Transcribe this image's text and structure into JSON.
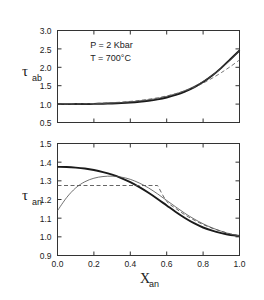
{
  "figure": {
    "background": "#ffffff",
    "line_color": "#1a1a1a",
    "thin_color": "#4d4d4d",
    "dash_color": "#555555"
  },
  "chart_data": [
    {
      "type": "line",
      "panel": "top",
      "title": "",
      "xlabel": "",
      "ylabel": "τab",
      "ylabel_main": "τ",
      "ylabel_sub": "ab",
      "xlim": [
        0.0,
        1.0
      ],
      "ylim": [
        0.5,
        3.0
      ],
      "yticks": [
        "0.5",
        "1.0",
        "1.5",
        "2.0",
        "2.5",
        "3.0"
      ],
      "ytick_values": [
        0.5,
        1.0,
        1.5,
        2.0,
        2.5,
        3.0
      ],
      "xticks": [
        "0.0",
        "0.2",
        "0.4",
        "0.6",
        "0.8",
        "1.0"
      ],
      "xtick_values": [
        0.0,
        0.2,
        0.4,
        0.6,
        0.8,
        1.0
      ],
      "xtick_labels_visible": false,
      "grid": false,
      "legend": "none",
      "annotations": [
        {
          "text": "P = 2 Kbar",
          "x": 0.18,
          "y": 2.52
        },
        {
          "text": "T = 700°C",
          "x": 0.18,
          "y": 2.18
        }
      ],
      "x": [
        0.0,
        0.05,
        0.1,
        0.15,
        0.2,
        0.25,
        0.3,
        0.35,
        0.4,
        0.45,
        0.5,
        0.55,
        0.6,
        0.65,
        0.7,
        0.75,
        0.8,
        0.85,
        0.9,
        0.95,
        1.0
      ],
      "series": [
        {
          "name": "bold-curve",
          "style": "solid-bold",
          "values": [
            1.0,
            1.0,
            1.001,
            1.003,
            1.006,
            1.011,
            1.018,
            1.028,
            1.042,
            1.062,
            1.09,
            1.128,
            1.18,
            1.25,
            1.34,
            1.455,
            1.6,
            1.775,
            1.985,
            2.22,
            2.455
          ]
        },
        {
          "name": "thin-curve",
          "style": "solid-thin",
          "values": [
            1.0,
            1.001,
            1.003,
            1.006,
            1.011,
            1.018,
            1.028,
            1.042,
            1.06,
            1.084,
            1.115,
            1.156,
            1.21,
            1.28,
            1.368,
            1.478,
            1.615,
            1.78,
            1.975,
            2.2,
            2.45
          ]
        },
        {
          "name": "dashed-curve",
          "style": "dashed",
          "values": [
            1.0,
            1.002,
            1.005,
            1.01,
            1.017,
            1.026,
            1.038,
            1.054,
            1.074,
            1.1,
            1.132,
            1.172,
            1.222,
            1.285,
            1.362,
            1.455,
            1.57,
            1.705,
            1.855,
            2.02,
            2.2
          ]
        }
      ]
    },
    {
      "type": "line",
      "panel": "bottom",
      "title": "",
      "xlabel": "Xan",
      "xlabel_main": "X",
      "xlabel_sub": "an",
      "ylabel": "τan",
      "ylabel_main": "τ",
      "ylabel_sub": "an",
      "xlim": [
        0.0,
        1.0
      ],
      "ylim": [
        0.9,
        1.5
      ],
      "yticks": [
        "0.9",
        "1.0",
        "1.1",
        "1.2",
        "1.3",
        "1.4",
        "1.5"
      ],
      "ytick_values": [
        0.9,
        1.0,
        1.1,
        1.2,
        1.3,
        1.4,
        1.5
      ],
      "xticks": [
        "0.0",
        "0.2",
        "0.4",
        "0.6",
        "0.8",
        "1.0"
      ],
      "xtick_values": [
        0.0,
        0.2,
        0.4,
        0.6,
        0.8,
        1.0
      ],
      "xtick_labels_visible": true,
      "grid": false,
      "legend": "none",
      "annotations": [],
      "x": [
        0.0,
        0.05,
        0.1,
        0.15,
        0.2,
        0.25,
        0.3,
        0.35,
        0.4,
        0.45,
        0.5,
        0.55,
        0.6,
        0.65,
        0.7,
        0.75,
        0.8,
        0.85,
        0.9,
        0.95,
        1.0
      ],
      "series": [
        {
          "name": "bold-curve",
          "style": "solid-bold",
          "values": [
            1.375,
            1.374,
            1.371,
            1.366,
            1.358,
            1.347,
            1.333,
            1.315,
            1.293,
            1.266,
            1.236,
            1.203,
            1.168,
            1.133,
            1.101,
            1.073,
            1.05,
            1.033,
            1.02,
            1.01,
            1.005
          ]
        },
        {
          "name": "thin-curve",
          "style": "solid-thin",
          "values": [
            1.14,
            1.21,
            1.262,
            1.295,
            1.314,
            1.323,
            1.325,
            1.32,
            1.308,
            1.288,
            1.262,
            1.23,
            1.195,
            1.16,
            1.126,
            1.096,
            1.07,
            1.048,
            1.03,
            1.015,
            1.005
          ]
        },
        {
          "name": "dashed-solvus",
          "style": "dashed-horizontal",
          "plateau_value": 1.275,
          "plateau_x_end": 0.55,
          "values": [
            1.275,
            1.275,
            1.275,
            1.275,
            1.275,
            1.275,
            1.275,
            1.275,
            1.275,
            1.275,
            1.275,
            1.275,
            1.19,
            1.152,
            1.118,
            1.09,
            1.066,
            1.046,
            1.03,
            1.016,
            1.005
          ]
        }
      ]
    }
  ]
}
